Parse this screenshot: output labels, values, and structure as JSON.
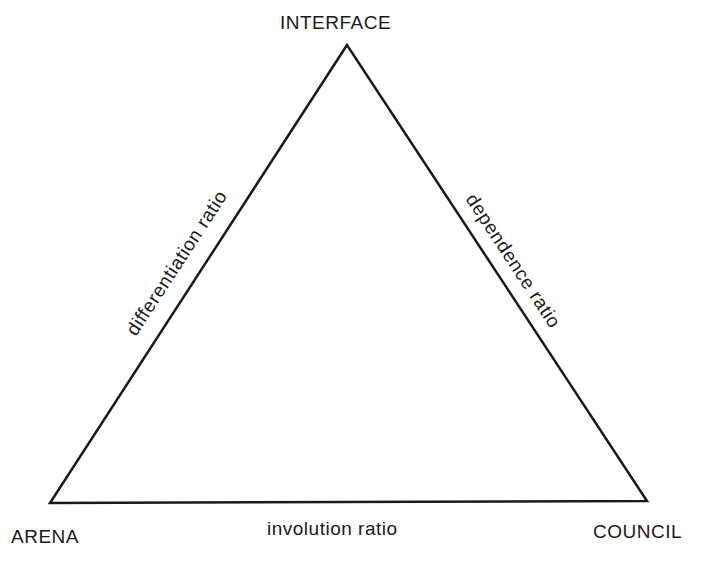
{
  "diagram": {
    "type": "triangle",
    "line_color": "#1a1a1a",
    "vertices": {
      "top": {
        "label": "INTERFACE",
        "x": 347,
        "y": 45
      },
      "bottom_left": {
        "label": "ARENA",
        "x": 50,
        "y": 503
      },
      "bottom_right": {
        "label": "COUNCIL",
        "x": 647,
        "y": 501
      }
    },
    "edges": {
      "left": {
        "label": "differentiation ratio"
      },
      "right": {
        "label": "dependence ratio"
      },
      "bottom": {
        "label": "involution ratio"
      }
    }
  }
}
